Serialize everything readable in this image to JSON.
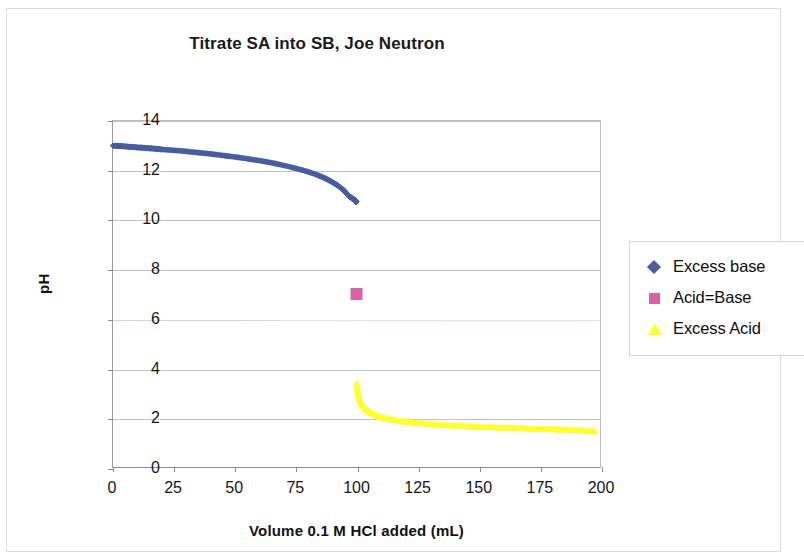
{
  "chart_data": {
    "type": "scatter",
    "title": "Titrate SA into SB, Joe Neutron",
    "xlabel": "Volume 0.1 M HCl added (mL)",
    "ylabel": "pH",
    "xlim": [
      0,
      200
    ],
    "ylim": [
      0,
      14
    ],
    "xticks": [
      0,
      25,
      50,
      75,
      100,
      125,
      150,
      175,
      200
    ],
    "yticks": [
      0,
      2,
      4,
      6,
      8,
      10,
      12,
      14
    ],
    "grid": "horizontal",
    "legend_position": "right",
    "series": [
      {
        "name": "Excess base",
        "marker": "diamond",
        "color": "#4a5e9e",
        "x": [
          0,
          2,
          4,
          6,
          8,
          10,
          12,
          14,
          16,
          18,
          20,
          24,
          28,
          32,
          36,
          40,
          44,
          48,
          52,
          56,
          60,
          64,
          68,
          72,
          76,
          80,
          84,
          86,
          88,
          90,
          92,
          94,
          95,
          96,
          97,
          98,
          98.5,
          99,
          99.3,
          99.5,
          99.7,
          99.8,
          99.9
        ],
        "y": [
          13.0,
          12.99,
          12.98,
          12.96,
          12.95,
          12.93,
          12.92,
          12.9,
          12.89,
          12.87,
          12.85,
          12.82,
          12.79,
          12.75,
          12.71,
          12.67,
          12.62,
          12.57,
          12.52,
          12.46,
          12.4,
          12.33,
          12.25,
          12.16,
          12.06,
          11.95,
          11.81,
          11.73,
          11.64,
          11.53,
          11.41,
          11.26,
          11.17,
          11.06,
          10.95,
          10.89,
          10.85,
          10.82,
          10.79,
          10.76,
          10.74,
          10.73,
          10.72
        ]
      },
      {
        "name": "Acid=Base",
        "marker": "square",
        "color": "#d763a6",
        "x": [
          100
        ],
        "y": [
          7.0
        ]
      },
      {
        "name": "Excess Acid",
        "marker": "triangle",
        "color": "#ffff33",
        "x": [
          100.1,
          100.2,
          100.4,
          100.6,
          100.8,
          101,
          101.5,
          102,
          103,
          104,
          105,
          106,
          108,
          110,
          112,
          115,
          118,
          120,
          124,
          128,
          132,
          136,
          140,
          144,
          148,
          152,
          156,
          160,
          164,
          168,
          172,
          176,
          180,
          184,
          188,
          192,
          196,
          198
        ],
        "y": [
          3.4,
          3.3,
          3.15,
          3.0,
          2.9,
          2.82,
          2.68,
          2.58,
          2.43,
          2.33,
          2.26,
          2.2,
          2.1,
          2.03,
          1.98,
          1.92,
          1.87,
          1.85,
          1.8,
          1.77,
          1.74,
          1.71,
          1.69,
          1.67,
          1.65,
          1.63,
          1.62,
          1.6,
          1.59,
          1.58,
          1.56,
          1.55,
          1.54,
          1.53,
          1.52,
          1.5,
          1.47,
          1.45
        ]
      }
    ]
  },
  "legend": {
    "items": [
      {
        "label": "Excess base",
        "marker": "diamond",
        "color": "#4a5e9e"
      },
      {
        "label": "Acid=Base",
        "marker": "square",
        "color": "#d763a6"
      },
      {
        "label": "Excess Acid",
        "marker": "triangle",
        "color": "#ffff33"
      }
    ]
  },
  "colors": {
    "excess_base": "#4a5e9e",
    "acid_equals_base": "#d763a6",
    "excess_acid": "#ffff33",
    "gridline": "#c2c2c2",
    "axis": "#8c8c8c",
    "background": "#ffffff"
  }
}
